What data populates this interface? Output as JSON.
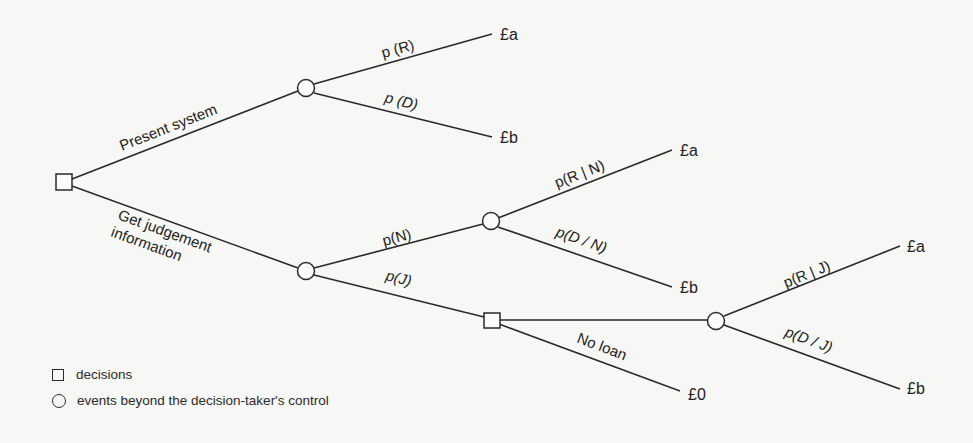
{
  "diagram": {
    "type": "decision-tree",
    "branches": {
      "present_system": "Present system",
      "get_info_line1": "Get judgement",
      "get_info_line2": "information",
      "no_loan": "No loan"
    },
    "probabilities": {
      "pR": "p (R)",
      "pD": "p (D)",
      "pN": "p(N)",
      "pJ": "p(J)",
      "pRN": "p(R | N)",
      "pDN": "p(D / N)",
      "pRJ": "p(R | J)",
      "pDJ": "p(D / J)"
    },
    "outcomes": {
      "ps_repay": "£a",
      "ps_default": "£b",
      "n_repay": "£a",
      "n_default": "£b",
      "j_repay": "£a",
      "j_default": "£b",
      "no_loan": "£0"
    }
  },
  "legend": {
    "decisions": "decisions",
    "events": "events beyond  the decision-taker's control"
  }
}
